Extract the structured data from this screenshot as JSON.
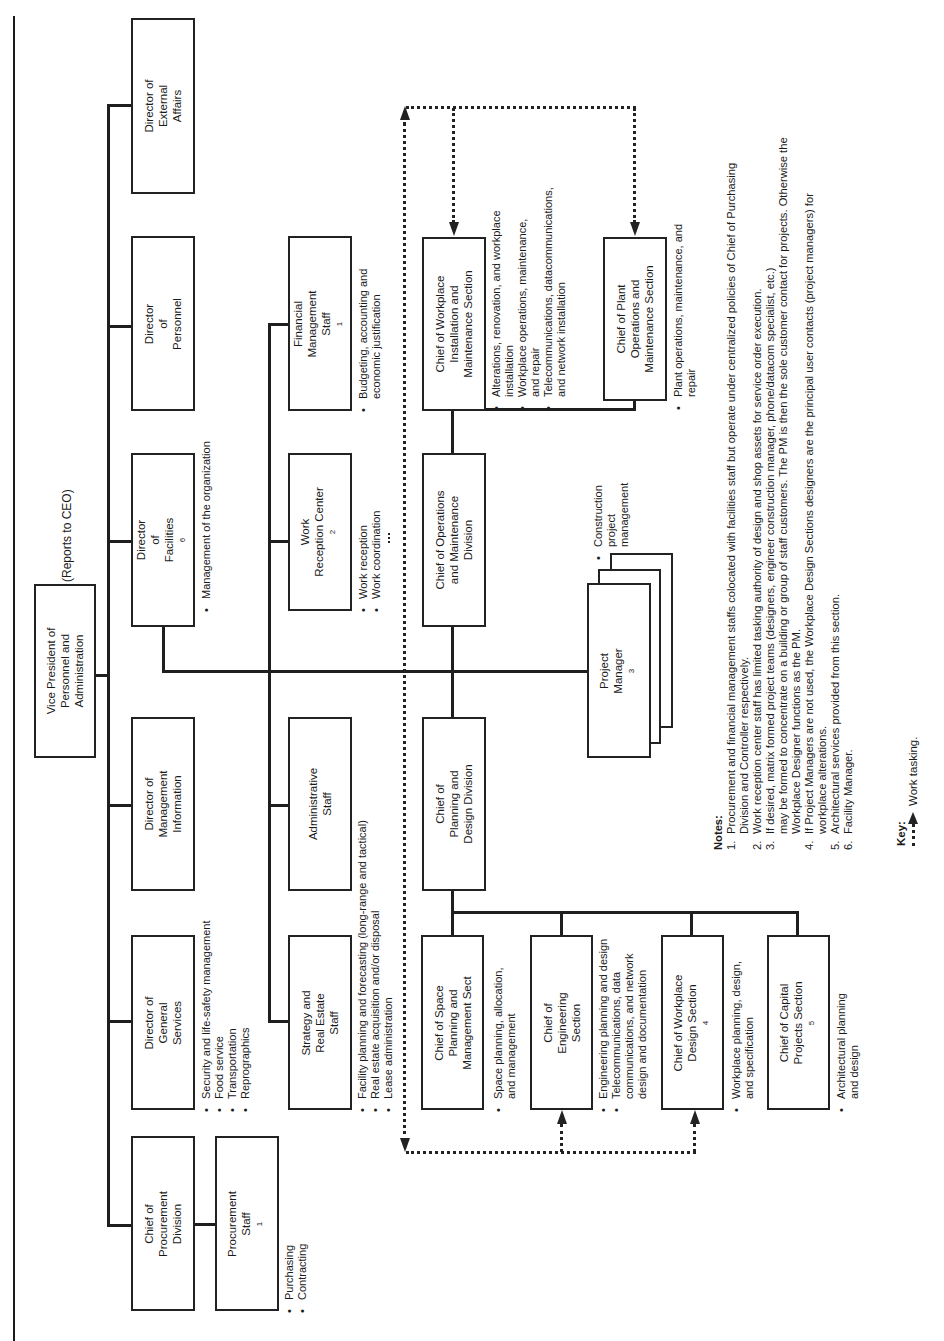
{
  "header": {
    "reports_to": "(Reports to CEO)"
  },
  "vp": {
    "lines": [
      "Vice President of",
      "Personnel and",
      "Administration"
    ]
  },
  "directors": [
    {
      "id": "external-affairs",
      "lines": [
        "Director of",
        "External",
        "Affairs"
      ]
    },
    {
      "id": "personnel",
      "lines": [
        "Director",
        "of",
        "Personnel"
      ]
    },
    {
      "id": "facilities",
      "lines": [
        "Director",
        "of",
        "Facilities"
      ],
      "sup": "6",
      "bullets": [
        "Management of the organization"
      ]
    },
    {
      "id": "management-information",
      "lines": [
        "Director of",
        "Management",
        "Information"
      ]
    },
    {
      "id": "general-services",
      "lines": [
        "Director of",
        "General",
        "Services"
      ],
      "bullets": [
        "Security and life-safety management",
        "Food service",
        "Transportation",
        "Reprographics"
      ]
    },
    {
      "id": "procurement-division",
      "lines": [
        "Chief of",
        "Procurement",
        "Division"
      ]
    }
  ],
  "procurement_staff": {
    "lines": [
      "Procurement",
      "Staff"
    ],
    "sup": "1",
    "bullets": [
      "Purchasing",
      "Contracting"
    ]
  },
  "facilities_staff": [
    {
      "id": "financial-management",
      "lines": [
        "Financial",
        "Management",
        "Staff"
      ],
      "sup": "1",
      "bullets": [
        "Budgeting, accounting and",
        "economic justification"
      ]
    },
    {
      "id": "work-reception",
      "lines": [
        "Work",
        "Reception Center"
      ],
      "sup": "2",
      "bullets": [
        "Work reception",
        "Work coordination"
      ]
    },
    {
      "id": "administrative",
      "lines": [
        "Administrative",
        "Staff"
      ]
    },
    {
      "id": "strategy-real-estate",
      "lines": [
        "Strategy and",
        "Real Estate",
        "Staff"
      ],
      "bullets": [
        "Facility planning and forecasting (long-range and tactical)",
        "Real estate acquisition and/or disposal",
        "Lease administration"
      ]
    }
  ],
  "divisions": {
    "operations": {
      "lines": [
        "Chief of Operations",
        "and Maintenance",
        "Division"
      ]
    },
    "planning": {
      "lines": [
        "Chief of",
        "Planning and",
        "Design Division"
      ]
    }
  },
  "operations_sections": [
    {
      "id": "workplace-installation",
      "lines": [
        "Chief of Workplace",
        "Installation and",
        "Maintenance Section"
      ],
      "bullets": [
        "Alterations, renovation, and workplace|installation",
        "Workplace operations, maintenance,|and repair",
        "Telecommunications, datacommunications,|and network installation"
      ]
    },
    {
      "id": "plant-operations",
      "lines": [
        "Chief of Plant",
        "Operations and",
        "Maintenance Section"
      ],
      "bullets": [
        "Plant operations, maintenance, and|repair"
      ]
    }
  ],
  "project_manager": {
    "lines": [
      "Project",
      "Manager"
    ],
    "sup": "3",
    "bullets": [
      "Construction|project|management"
    ]
  },
  "planning_sections": [
    {
      "id": "space-planning",
      "lines": [
        "Chief of Space",
        "Planning and",
        "Management Sect"
      ],
      "bullets": [
        "Space planning, allocation,|and management"
      ]
    },
    {
      "id": "engineering",
      "lines": [
        "Chief of",
        "Engineering",
        "Section"
      ],
      "bullets": [
        "Engineering planning and design",
        "Telecommunications, data|communications, and network|design and documentation"
      ]
    },
    {
      "id": "workplace-design",
      "lines": [
        "Chief of Workplace",
        "Design Section"
      ],
      "sup": "4",
      "bullets": [
        "Workplace planning, design,|and specification"
      ]
    },
    {
      "id": "capital-projects",
      "lines": [
        "Chief of Capital",
        "Projects Section"
      ],
      "sup": "5",
      "bullets": [
        "Architectural planning|and design"
      ]
    }
  ],
  "notes": {
    "title": "Notes:",
    "items": [
      {
        "n": "1.",
        "lines": [
          "Procurement and financial management staffs colocated with facilities staff but operate under centralized policies of Chief of Purchasing",
          "Division and Controller respectively."
        ]
      },
      {
        "n": "2.",
        "lines": [
          "Work reception center staff has limited tasking authority of design and shop assets for service order execution."
        ]
      },
      {
        "n": "3.",
        "lines": [
          "If desired, matrix formed project teams (designers, engineer construction manager, phone/datacom specialist, etc.)",
          "may be formed to concentrate on a building or group of staff customers. The PM is then the sole customer contact for projects. Otherwise the",
          "Workplace Designer functions as the PM."
        ]
      },
      {
        "n": "4.",
        "lines": [
          "If Project Managers are not used, the Workplace Design Sections designers are the principal user contacts (project managers) for",
          "workplace alterations."
        ]
      },
      {
        "n": "5.",
        "lines": [
          "Architectural services provided from this section."
        ]
      },
      {
        "n": "6.",
        "lines": [
          "Facility Manager."
        ]
      }
    ]
  },
  "key": {
    "title": "Key:",
    "label": "Work tasking."
  }
}
